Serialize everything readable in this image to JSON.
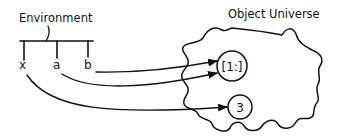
{
  "diagram": {
    "environment": {
      "title": "Environment",
      "variables": [
        {
          "name": "x",
          "points_to": "3"
        },
        {
          "name": "a",
          "points_to": "[1:]"
        },
        {
          "name": "b",
          "points_to": "[1:]"
        }
      ]
    },
    "object_universe": {
      "title": "Object Universe",
      "objects": [
        {
          "label": "[1:]"
        },
        {
          "label": "3"
        }
      ]
    },
    "colors": {
      "ink": "#111111",
      "background": "#ffffff"
    }
  }
}
